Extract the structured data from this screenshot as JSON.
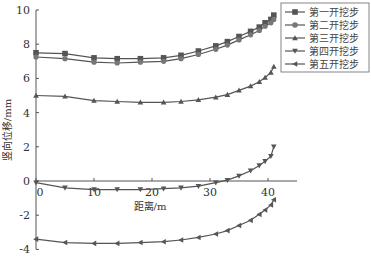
{
  "chart_data": {
    "type": "line",
    "title": "",
    "xlabel": "距离/m",
    "ylabel": "竖向位移/mm",
    "xlim": [
      0,
      45
    ],
    "ylim": [
      -4,
      10
    ],
    "xticks": [
      0,
      10,
      20,
      30,
      40
    ],
    "yticks": [
      -4,
      -2,
      0,
      2,
      4,
      6,
      8,
      10
    ],
    "grid": false,
    "legend_position": "top-right",
    "series": [
      {
        "name": "第一开挖步",
        "marker": "square",
        "x": [
          0,
          5,
          10,
          14,
          18,
          22,
          25,
          28,
          31,
          33,
          35,
          37,
          38.5,
          39.5,
          40.5,
          41
        ],
        "y": [
          7.5,
          7.45,
          7.2,
          7.15,
          7.15,
          7.2,
          7.35,
          7.6,
          7.9,
          8.15,
          8.45,
          8.75,
          9.0,
          9.25,
          9.45,
          9.7
        ]
      },
      {
        "name": "第二开挖步",
        "marker": "circle",
        "x": [
          0,
          5,
          10,
          14,
          18,
          22,
          25,
          28,
          31,
          33,
          35,
          37,
          38.5,
          39.5,
          40.5,
          41
        ],
        "y": [
          7.25,
          7.15,
          6.95,
          6.9,
          6.95,
          7.0,
          7.15,
          7.4,
          7.7,
          7.95,
          8.25,
          8.55,
          8.8,
          9.05,
          9.25,
          9.45
        ]
      },
      {
        "name": "第三开挖步",
        "marker": "triangle-up",
        "x": [
          0,
          5,
          10,
          14,
          18,
          22,
          25,
          28,
          31,
          33,
          35,
          37,
          38.5,
          39.5,
          40.5,
          41
        ],
        "y": [
          5.0,
          4.95,
          4.7,
          4.65,
          4.6,
          4.6,
          4.65,
          4.75,
          4.9,
          5.05,
          5.3,
          5.55,
          5.8,
          6.05,
          6.35,
          6.7
        ]
      },
      {
        "name": "第四开挖步",
        "marker": "triangle-down",
        "x": [
          0,
          5,
          10,
          14,
          18,
          22,
          25,
          28,
          31,
          33,
          35,
          37,
          38.5,
          39.5,
          40.5,
          41
        ],
        "y": [
          -0.1,
          -0.4,
          -0.5,
          -0.5,
          -0.5,
          -0.45,
          -0.4,
          -0.3,
          -0.1,
          0.05,
          0.3,
          0.6,
          0.9,
          1.15,
          1.45,
          2.0
        ]
      },
      {
        "name": "第五开挖步",
        "marker": "triangle-left",
        "x": [
          0,
          5,
          10,
          14,
          18,
          22,
          25,
          28,
          31,
          33,
          35,
          37,
          38.5,
          39.5,
          40.5,
          41
        ],
        "y": [
          -3.4,
          -3.6,
          -3.65,
          -3.65,
          -3.6,
          -3.55,
          -3.45,
          -3.3,
          -3.1,
          -2.9,
          -2.6,
          -2.3,
          -1.95,
          -1.7,
          -1.4,
          -1.1
        ]
      }
    ]
  }
}
